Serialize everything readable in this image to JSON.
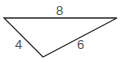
{
  "diagram": {
    "type": "triangle",
    "stroke_color": "#333333",
    "label_color": "#555555",
    "vertices": [
      [
        4,
        18
      ],
      [
        117,
        18
      ],
      [
        43,
        57
      ]
    ],
    "sides": [
      {
        "name": "top",
        "label": "8"
      },
      {
        "name": "left",
        "label": "4"
      },
      {
        "name": "right",
        "label": "6"
      }
    ]
  }
}
